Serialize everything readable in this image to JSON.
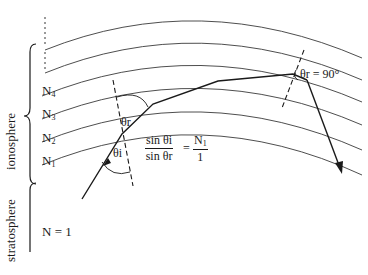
{
  "diagram": {
    "regions": {
      "upper": "ionosphere",
      "lower": "stratosphere"
    },
    "layer_labels": [
      {
        "base": "N",
        "sub": "4"
      },
      {
        "base": "N",
        "sub": "3"
      },
      {
        "base": "N",
        "sub": "2"
      },
      {
        "base": "N",
        "sub": "1"
      }
    ],
    "base_medium_label": "N = 1",
    "angles": {
      "incidence": "θi",
      "refraction": "θr",
      "critical": "θr = 90°"
    },
    "formula": {
      "lhs_numerator": "sin θi",
      "lhs_denominator": "sin θr",
      "equals": "=",
      "rhs_numerator_base": "N",
      "rhs_numerator_sub": "1",
      "rhs_denominator": "1"
    },
    "colors": {
      "line": "#1a1a1a",
      "curve": "#3a3a3a",
      "background": "#ffffff"
    }
  }
}
